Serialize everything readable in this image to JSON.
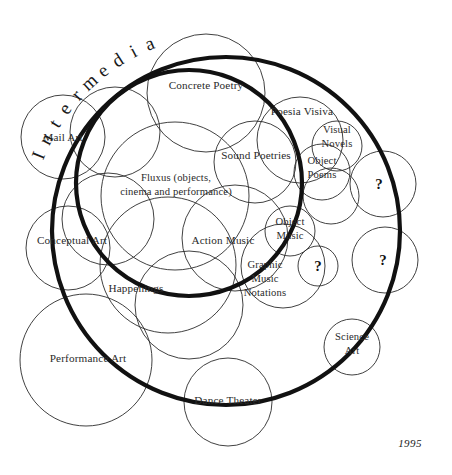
{
  "diagram": {
    "title": "Intermedia",
    "date": "1995",
    "canvas": {
      "width": 452,
      "height": 475
    },
    "boundaries": [
      {
        "name": "intermedia-outer-boundary",
        "cx": 226,
        "cy": 231,
        "r": 174
      },
      {
        "name": "intermedia-inner-boundary",
        "cx": 189,
        "cy": 183,
        "r": 113
      }
    ],
    "title_arc": {
      "cx": 226,
      "cy": 231,
      "r": 196,
      "start_deg": -68,
      "char_spacing_deg": 5.1
    },
    "date_pos": {
      "x": 410,
      "y": 447
    },
    "fields": [
      {
        "id": "mail-art",
        "label": "Mail Art",
        "cx": 63,
        "cy": 137,
        "r": 42,
        "lines": [
          "Mail Art"
        ],
        "tx": 63,
        "ty": 141
      },
      {
        "id": "concrete-poetry",
        "label": "Concrete Poetry",
        "cx": 206,
        "cy": 93,
        "r": 59,
        "lines": [
          "Concrete Poetry"
        ],
        "tx": 206,
        "ty": 89
      },
      {
        "id": "poesia-visiva",
        "label": "Poesia Visiva",
        "cx": 300,
        "cy": 140,
        "r": 43,
        "lines": [
          "Poesia Visiva"
        ],
        "tx": 302,
        "ty": 115
      },
      {
        "id": "visual-novels",
        "label": "Visual Novels",
        "cx": 337,
        "cy": 146,
        "r": 25,
        "lines": [
          "Visual",
          "Novels"
        ],
        "tx": 337,
        "ty": 133
      },
      {
        "id": "sound-poetries",
        "label": "Sound Poetries",
        "cx": 255,
        "cy": 162,
        "r": 41,
        "lines": [
          "Sound Poetries"
        ],
        "tx": 256,
        "ty": 159
      },
      {
        "id": "object-poems",
        "label": "Object Poems",
        "cx": 322,
        "cy": 172,
        "r": 28,
        "lines": [
          "Object",
          "Poems"
        ],
        "tx": 322,
        "ty": 164
      },
      {
        "id": "fluxus",
        "label": "Fluxus (objects, cinema and performance)",
        "cx": 175,
        "cy": 196,
        "r": 74,
        "lines": [
          "Fluxus (objects,",
          "cinema and performance)"
        ],
        "tx": 176,
        "ty": 181
      },
      {
        "id": "conceptual-art",
        "label": "Conceptual Art",
        "cx": 68,
        "cy": 248,
        "r": 42,
        "lines": [
          "Conceptual Art"
        ],
        "tx": 72,
        "ty": 244
      },
      {
        "id": "happenings",
        "label": "Happenings",
        "cx": 168,
        "cy": 265,
        "r": 68,
        "lines": [
          "Happenings"
        ],
        "tx": 136,
        "ty": 292
      },
      {
        "id": "action-music",
        "label": "Action Music",
        "cx": 235,
        "cy": 238,
        "r": 53,
        "lines": [
          "Action Music"
        ],
        "tx": 223,
        "ty": 244
      },
      {
        "id": "object-music",
        "label": "Object Music",
        "cx": 290,
        "cy": 231,
        "r": 25,
        "lines": [
          "Object",
          "Music"
        ],
        "tx": 290,
        "ty": 225
      },
      {
        "id": "graphic-music-notations",
        "label": "Graphic Music Notations",
        "cx": 283,
        "cy": 266,
        "r": 42,
        "lines": [
          "Graphic",
          "Music",
          "Notations"
        ],
        "tx": 265,
        "ty": 268
      },
      {
        "id": "performance-art",
        "label": "Performance Art",
        "cx": 86,
        "cy": 360,
        "r": 66,
        "lines": [
          "Performance Art"
        ],
        "tx": 88,
        "ty": 362
      },
      {
        "id": "dance-theater",
        "label": "Dance Theater",
        "cx": 228,
        "cy": 402,
        "r": 44,
        "lines": [
          "Dance Theater"
        ],
        "tx": 228,
        "ty": 404
      },
      {
        "id": "science-art",
        "label": "Science Art",
        "cx": 352,
        "cy": 347,
        "r": 28,
        "lines": [
          "Science",
          "Art"
        ],
        "tx": 352,
        "ty": 340
      }
    ],
    "unknown_fields": [
      {
        "id": "unknown-upper-right",
        "label": "?",
        "cx": 383,
        "cy": 184,
        "r": 33,
        "tx": 379,
        "ty": 189
      },
      {
        "id": "unknown-lower-right",
        "label": "?",
        "cx": 385,
        "cy": 260,
        "r": 33,
        "tx": 383,
        "ty": 265
      },
      {
        "id": "unknown-center",
        "label": "?",
        "cx": 318,
        "cy": 266,
        "r": 20,
        "tx": 318,
        "ty": 271
      }
    ],
    "blank_circles": [
      {
        "id": "blank-upper-left",
        "cx": 115,
        "cy": 132,
        "r": 45
      },
      {
        "id": "blank-left-mid",
        "cx": 108,
        "cy": 219,
        "r": 46
      },
      {
        "id": "blank-center-low",
        "cx": 189,
        "cy": 305,
        "r": 54
      },
      {
        "id": "blank-right-high",
        "cx": 331,
        "cy": 196,
        "r": 28
      }
    ]
  }
}
